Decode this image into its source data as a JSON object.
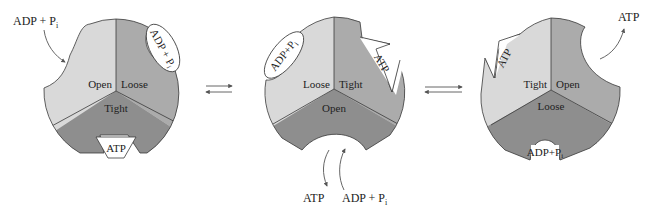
{
  "colors": {
    "light": "#d9d9d9",
    "medium": "#ababab",
    "dark": "#8e8e8e",
    "outline": "#3a3a3a",
    "background": "#ffffff"
  },
  "states": [
    {
      "sectors": {
        "upper_left": "Open",
        "upper_right": "Loose",
        "bottom": "Tight"
      },
      "bound": {
        "loose_site": "ADP + Pi",
        "tight_site": "ATP"
      },
      "external": {
        "label": "ADP + P",
        "subscript": "i",
        "direction": "entering"
      }
    },
    {
      "sectors": {
        "upper_left": "Loose",
        "upper_right": "Tight",
        "bottom": "Open"
      },
      "bound": {
        "loose_site": "ADP+P",
        "loose_site_sub": "i",
        "tight_site": "ATP"
      },
      "external": {
        "out_label": "ATP",
        "in_label": "ADP + P",
        "in_subscript": "i"
      }
    },
    {
      "sectors": {
        "upper_left": "Tight",
        "upper_right": "Open",
        "bottom": "Loose"
      },
      "bound": {
        "tight_site": "ATP",
        "loose_site": "ADP+P",
        "loose_site_sub": "i"
      },
      "external": {
        "label": "ATP",
        "direction": "leaving"
      }
    }
  ],
  "arrows": [
    "equilibrium",
    "equilibrium"
  ],
  "text": {
    "s1_open": "Open",
    "s1_loose": "Loose",
    "s1_tight": "Tight",
    "s1_notch_loose": "ADP + P",
    "s1_notch_loose_sub": "i",
    "s1_notch_tight": "ATP",
    "s1_ext": "ADP + P",
    "s1_ext_sub": "i",
    "s2_loose": "Loose",
    "s2_tight": "Tight",
    "s2_open": "Open",
    "s2_notch_loose": "ADP+P",
    "s2_notch_loose_sub": "i",
    "s2_notch_tight": "ATP",
    "s2_ext_out": "ATP",
    "s2_ext_in": "ADP + P",
    "s2_ext_in_sub": "i",
    "s3_tight": "Tight",
    "s3_open": "Open",
    "s3_loose": "Loose",
    "s3_notch_tight": "ATP",
    "s3_notch_loose": "ADP+P",
    "s3_notch_loose_sub": "i",
    "s3_ext": "ATP"
  }
}
